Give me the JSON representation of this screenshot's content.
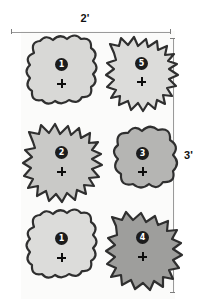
{
  "diagram": {
    "panel": {
      "background": "#fbfbfa"
    },
    "dimensions": [
      {
        "name": "width",
        "label": "2'",
        "orientation": "horizontal",
        "position": "top"
      },
      {
        "name": "height",
        "label": "3'",
        "orientation": "vertical",
        "position": "right"
      }
    ],
    "marker_icon": "plus-marker-icon",
    "shapes": [
      {
        "id": "shape-top-left",
        "number": "1",
        "edge_style": "rounded-bumps",
        "fill": "#d8d8d6",
        "stroke": "#2f2f2f",
        "row": 1,
        "column": 1
      },
      {
        "id": "shape-top-right",
        "number": "5",
        "edge_style": "spiky",
        "fill": "#dcdcda",
        "stroke": "#2f2f2f",
        "row": 1,
        "column": 2
      },
      {
        "id": "shape-middle-left",
        "number": "2",
        "edge_style": "spiky",
        "fill": "#c9c9c7",
        "stroke": "#2f2f2f",
        "row": 2,
        "column": 1
      },
      {
        "id": "shape-middle-right",
        "number": "3",
        "edge_style": "large-rounded-bumps",
        "fill": "#b5b5b3",
        "stroke": "#2f2f2f",
        "row": 2,
        "column": 2
      },
      {
        "id": "shape-bottom-left",
        "number": "1",
        "edge_style": "rounded-bumps",
        "fill": "#dcdcda",
        "stroke": "#2f2f2f",
        "row": 3,
        "column": 1
      },
      {
        "id": "shape-bottom-right",
        "number": "4",
        "edge_style": "wavy",
        "fill": "#9e9e9c",
        "stroke": "#2f2f2f",
        "row": 3,
        "column": 2
      }
    ]
  }
}
